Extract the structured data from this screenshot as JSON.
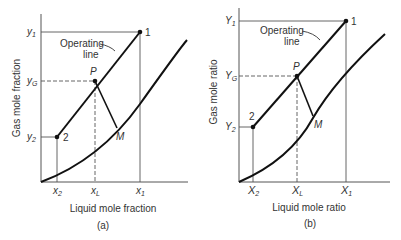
{
  "panel_a": {
    "caption": "(a)",
    "xlabel": "Liquid mole fraction",
    "ylabel": "Gas mole fraction",
    "operating_line_label_1": "Operating",
    "operating_line_label_2": "line",
    "x_ticks": {
      "x2": "x",
      "x2_sub": "2",
      "xL": "x",
      "xL_sub": "L",
      "x1": "x",
      "x1_sub": "1"
    },
    "y_ticks": {
      "y1": "y",
      "y1_sub": "1",
      "yG": "y",
      "yG_sub": "G",
      "y2": "y",
      "y2_sub": "2"
    },
    "points": {
      "p1": "1",
      "p2": "2",
      "P": "P",
      "M": "M"
    }
  },
  "panel_b": {
    "caption": "(b)",
    "xlabel": "Liquid mole ratio",
    "ylabel": "Gas mole ratio",
    "operating_line_label_1": "Operating",
    "operating_line_label_2": "line",
    "x_ticks": {
      "x2": "X",
      "x2_sub": "2",
      "xL": "X",
      "xL_sub": "L",
      "x1": "X",
      "x1_sub": "1"
    },
    "y_ticks": {
      "y1": "Y",
      "y1_sub": "1",
      "yG": "Y",
      "yG_sub": "G",
      "y2": "Y",
      "y2_sub": "2"
    },
    "points": {
      "p1": "1",
      "p2": "2",
      "P": "P",
      "M": "M"
    }
  }
}
